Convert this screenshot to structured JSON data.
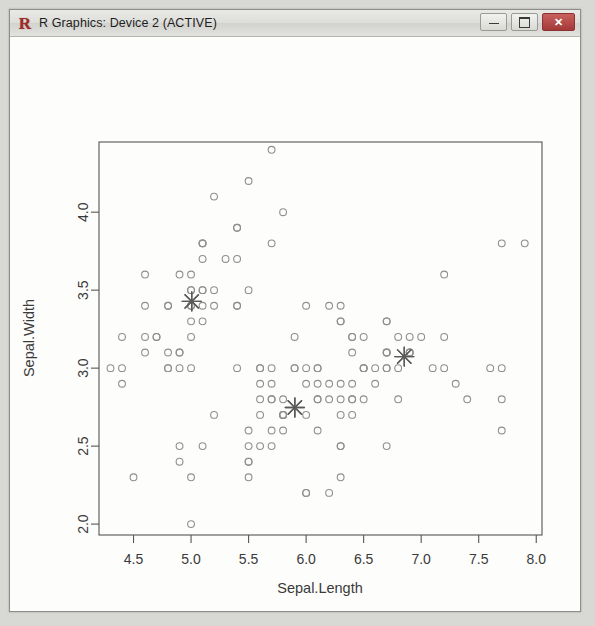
{
  "window": {
    "title": "R Graphics: Device 2 (ACTIVE)",
    "logo_letter": "R",
    "buttons": {
      "minimize_label": "–",
      "maximize_label": "□",
      "close_label": "✕"
    }
  },
  "chart_data": {
    "type": "scatter",
    "title": "",
    "xlabel": "Sepal.Length",
    "ylabel": "Sepal.Width",
    "xlim": [
      4.2,
      8.05
    ],
    "ylim": [
      1.93,
      4.45
    ],
    "xticks": [
      "4.5",
      "5.0",
      "5.5",
      "6.0",
      "6.5",
      "7.0",
      "7.5",
      "8.0"
    ],
    "xtick_values": [
      4.5,
      5.0,
      5.5,
      6.0,
      6.5,
      7.0,
      7.5,
      8.0
    ],
    "yticks": [
      "2.0",
      "2.5",
      "3.0",
      "3.5",
      "4.0"
    ],
    "ytick_values": [
      2.0,
      2.5,
      3.0,
      3.5,
      4.0
    ],
    "grid": false,
    "legend": null,
    "point_style": {
      "marker": "open-circle",
      "radius": 3.4,
      "color": "#8f8f8f",
      "stroke_width": 1.1
    },
    "center_style": {
      "marker": "asterisk-star",
      "size": 9.5,
      "color": "#5a5a5a",
      "stroke_width": 1.4
    },
    "series": [
      {
        "name": "observations",
        "points": [
          [
            5.1,
            3.5
          ],
          [
            4.9,
            3.0
          ],
          [
            4.7,
            3.2
          ],
          [
            4.6,
            3.1
          ],
          [
            5.0,
            3.6
          ],
          [
            5.4,
            3.9
          ],
          [
            4.6,
            3.4
          ],
          [
            5.0,
            3.4
          ],
          [
            4.4,
            2.9
          ],
          [
            4.9,
            3.1
          ],
          [
            5.4,
            3.7
          ],
          [
            4.8,
            3.4
          ],
          [
            4.8,
            3.0
          ],
          [
            4.3,
            3.0
          ],
          [
            5.8,
            4.0
          ],
          [
            5.7,
            4.4
          ],
          [
            5.4,
            3.9
          ],
          [
            5.1,
            3.5
          ],
          [
            5.7,
            3.8
          ],
          [
            5.1,
            3.8
          ],
          [
            5.4,
            3.4
          ],
          [
            5.1,
            3.7
          ],
          [
            4.6,
            3.6
          ],
          [
            5.1,
            3.3
          ],
          [
            4.8,
            3.4
          ],
          [
            5.0,
            3.0
          ],
          [
            5.0,
            3.4
          ],
          [
            5.2,
            3.5
          ],
          [
            5.2,
            3.4
          ],
          [
            4.7,
            3.2
          ],
          [
            4.8,
            3.1
          ],
          [
            5.4,
            3.4
          ],
          [
            5.2,
            4.1
          ],
          [
            5.5,
            4.2
          ],
          [
            4.9,
            3.1
          ],
          [
            5.0,
            3.2
          ],
          [
            5.5,
            3.5
          ],
          [
            4.9,
            3.6
          ],
          [
            4.4,
            3.0
          ],
          [
            5.1,
            3.4
          ],
          [
            5.0,
            3.5
          ],
          [
            4.5,
            2.3
          ],
          [
            4.4,
            3.2
          ],
          [
            5.0,
            3.5
          ],
          [
            5.1,
            3.8
          ],
          [
            4.8,
            3.0
          ],
          [
            5.1,
            3.8
          ],
          [
            4.6,
            3.2
          ],
          [
            5.3,
            3.7
          ],
          [
            5.0,
            3.3
          ],
          [
            7.0,
            3.2
          ],
          [
            6.4,
            3.2
          ],
          [
            6.9,
            3.1
          ],
          [
            5.5,
            2.3
          ],
          [
            6.5,
            2.8
          ],
          [
            5.7,
            2.8
          ],
          [
            6.3,
            3.3
          ],
          [
            4.9,
            2.4
          ],
          [
            6.6,
            2.9
          ],
          [
            5.2,
            2.7
          ],
          [
            5.0,
            2.0
          ],
          [
            5.9,
            3.0
          ],
          [
            6.0,
            2.2
          ],
          [
            6.1,
            2.9
          ],
          [
            5.6,
            2.9
          ],
          [
            6.7,
            3.1
          ],
          [
            5.6,
            3.0
          ],
          [
            5.8,
            2.7
          ],
          [
            6.2,
            2.2
          ],
          [
            5.6,
            2.5
          ],
          [
            5.9,
            3.2
          ],
          [
            6.1,
            2.8
          ],
          [
            6.3,
            2.5
          ],
          [
            6.1,
            2.8
          ],
          [
            6.4,
            2.9
          ],
          [
            6.6,
            3.0
          ],
          [
            6.8,
            2.8
          ],
          [
            6.7,
            3.0
          ],
          [
            6.0,
            2.9
          ],
          [
            5.7,
            2.6
          ],
          [
            5.5,
            2.4
          ],
          [
            5.5,
            2.4
          ],
          [
            5.8,
            2.7
          ],
          [
            6.0,
            2.7
          ],
          [
            5.4,
            3.0
          ],
          [
            6.0,
            3.4
          ],
          [
            6.7,
            3.1
          ],
          [
            6.3,
            2.3
          ],
          [
            5.6,
            3.0
          ],
          [
            5.5,
            2.5
          ],
          [
            5.5,
            2.6
          ],
          [
            6.1,
            3.0
          ],
          [
            5.8,
            2.6
          ],
          [
            5.0,
            2.3
          ],
          [
            5.6,
            2.7
          ],
          [
            5.7,
            3.0
          ],
          [
            5.7,
            2.9
          ],
          [
            6.2,
            2.9
          ],
          [
            5.1,
            2.5
          ],
          [
            5.7,
            2.8
          ],
          [
            6.3,
            3.3
          ],
          [
            5.8,
            2.7
          ],
          [
            7.1,
            3.0
          ],
          [
            6.3,
            2.9
          ],
          [
            6.5,
            3.0
          ],
          [
            7.6,
            3.0
          ],
          [
            4.9,
            2.5
          ],
          [
            7.3,
            2.9
          ],
          [
            6.7,
            2.5
          ],
          [
            7.2,
            3.6
          ],
          [
            6.5,
            3.2
          ],
          [
            6.4,
            2.7
          ],
          [
            6.8,
            3.0
          ],
          [
            5.7,
            2.5
          ],
          [
            5.8,
            2.8
          ],
          [
            6.4,
            3.2
          ],
          [
            6.5,
            3.0
          ],
          [
            7.7,
            3.8
          ],
          [
            7.7,
            2.6
          ],
          [
            6.0,
            2.2
          ],
          [
            6.9,
            3.2
          ],
          [
            5.6,
            2.8
          ],
          [
            7.7,
            2.8
          ],
          [
            6.3,
            2.7
          ],
          [
            6.7,
            3.3
          ],
          [
            7.2,
            3.2
          ],
          [
            6.2,
            2.8
          ],
          [
            6.1,
            3.0
          ],
          [
            6.4,
            2.8
          ],
          [
            7.2,
            3.0
          ],
          [
            7.4,
            2.8
          ],
          [
            7.9,
            3.8
          ],
          [
            6.4,
            2.8
          ],
          [
            6.3,
            2.8
          ],
          [
            6.1,
            2.6
          ],
          [
            7.7,
            3.0
          ],
          [
            6.3,
            3.4
          ],
          [
            6.4,
            3.1
          ],
          [
            6.0,
            3.0
          ],
          [
            6.9,
            3.1
          ],
          [
            6.7,
            3.1
          ],
          [
            6.9,
            3.1
          ],
          [
            5.8,
            2.7
          ],
          [
            6.8,
            3.2
          ],
          [
            6.7,
            3.3
          ],
          [
            6.7,
            3.0
          ],
          [
            6.3,
            2.5
          ],
          [
            6.5,
            3.0
          ],
          [
            6.2,
            3.4
          ],
          [
            5.9,
            3.0
          ]
        ]
      },
      {
        "name": "cluster-centers",
        "points": [
          [
            5.006,
            3.428
          ],
          [
            6.853,
            3.074
          ],
          [
            5.902,
            2.748
          ]
        ]
      }
    ]
  }
}
